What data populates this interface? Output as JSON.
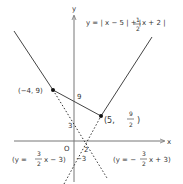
{
  "diagram": {
    "type": "function-graph",
    "function_label": "y = |x − 5| + |½x + 2|",
    "function_parts": {
      "prefix": "y = | x − 5 | + |",
      "frac_num": "1",
      "frac_den": "2",
      "suffix": "x + 2 |"
    },
    "axes": {
      "x_label": "x",
      "y_label": "y",
      "origin_label": "O"
    },
    "points": [
      {
        "label": "(−4, 9)",
        "x": -4,
        "y": 9
      },
      {
        "label_prefix": "(5,",
        "frac_num": "9",
        "frac_den": "2",
        "label_suffix": ")",
        "x": 5,
        "y": 4.5
      }
    ],
    "tick_labels": {
      "y_9": "9",
      "y_3": "3",
      "y_neg3": "−3",
      "x_2": "2"
    },
    "auxiliary_lines": [
      {
        "label_prefix": "(y =",
        "frac_num": "3",
        "frac_den": "2",
        "label_suffix": "x − 3)",
        "slope": 1.5,
        "intercept": -3,
        "style": "dotted"
      },
      {
        "label_prefix": "(y = −",
        "frac_num": "3",
        "frac_den": "2",
        "label_suffix": "x + 3)",
        "slope": -1.5,
        "intercept": 3,
        "style": "dotted"
      }
    ],
    "colors": {
      "ink": "#333333",
      "axis": "#777777"
    }
  }
}
